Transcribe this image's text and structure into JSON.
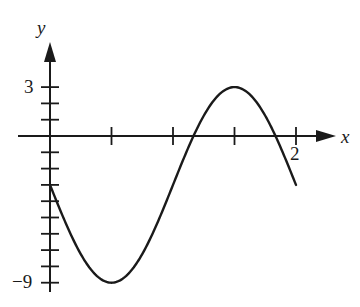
{
  "chart_data": {
    "type": "line",
    "title": "",
    "xlabel": "x",
    "ylabel": "y",
    "function_description": "sinusoid y = -3 - 6 sin(pi x) on [0, 2]",
    "x_tick_step": 0.5,
    "y_tick_step": 1,
    "xlim": [
      0,
      2
    ],
    "ylim": [
      -9,
      3
    ],
    "x_tick_labels": [
      {
        "value": 2,
        "label": "2"
      }
    ],
    "y_tick_labels": [
      {
        "value": 3,
        "label": "3"
      },
      {
        "value": -9,
        "label": "-9"
      }
    ],
    "key_points": [
      {
        "x": 0,
        "y": -3
      },
      {
        "x": 0.5,
        "y": -9
      },
      {
        "x": 1.0,
        "y": -3
      },
      {
        "x": 1.167,
        "y": 0
      },
      {
        "x": 1.5,
        "y": 3
      },
      {
        "x": 1.833,
        "y": 0
      },
      {
        "x": 2.0,
        "y": -3
      }
    ],
    "grid": false,
    "legend": null
  },
  "labels": {
    "x_axis": "x",
    "y_axis": "y",
    "y_top": "3",
    "y_bottom": "−9",
    "x_right": "2"
  },
  "colors": {
    "ink": "#1a1a1a",
    "background": "#ffffff"
  }
}
